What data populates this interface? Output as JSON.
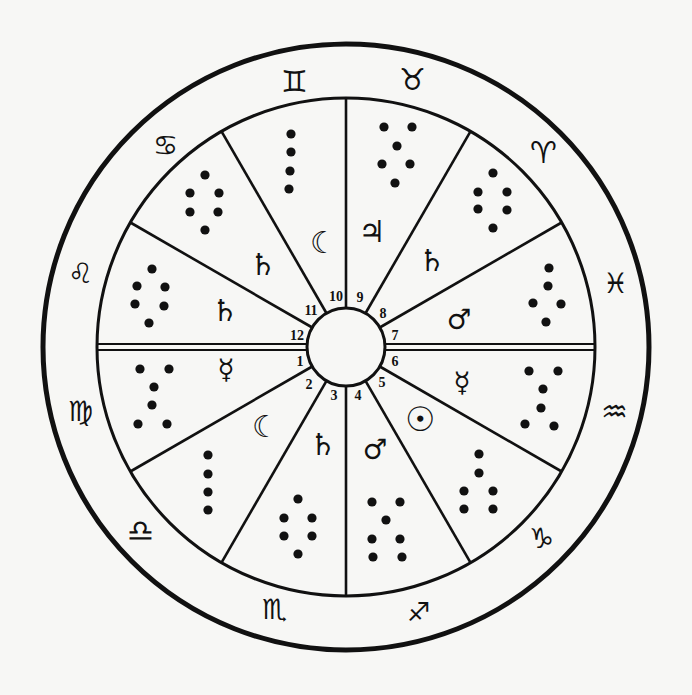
{
  "diagram": {
    "type": "astrological-house-chart",
    "colors": {
      "ink": "#111111",
      "paper": "#f7f7f5"
    },
    "geometry": {
      "cx": 346,
      "cy": 347,
      "outer_r": 303,
      "ring_r": 249,
      "hub_r": 39
    },
    "zodiac_signs": [
      {
        "name": "gemini",
        "glyph": "♊",
        "x": 294,
        "y": 81,
        "size": 30
      },
      {
        "name": "taurus",
        "glyph": "♉",
        "x": 412,
        "y": 79,
        "size": 30
      },
      {
        "name": "cancer",
        "glyph": "♋",
        "x": 165,
        "y": 145,
        "size": 28
      },
      {
        "name": "aries",
        "glyph": "♈",
        "x": 543,
        "y": 152,
        "size": 30
      },
      {
        "name": "leo",
        "glyph": "♌",
        "x": 80,
        "y": 273,
        "size": 28
      },
      {
        "name": "pisces",
        "glyph": "♓",
        "x": 615,
        "y": 283,
        "size": 28
      },
      {
        "name": "virgo",
        "glyph": "♍",
        "x": 80,
        "y": 411,
        "size": 28
      },
      {
        "name": "aquarius",
        "glyph": "♒",
        "x": 614,
        "y": 411,
        "size": 30
      },
      {
        "name": "libra",
        "glyph": "♎",
        "x": 140,
        "y": 530,
        "size": 30
      },
      {
        "name": "capricorn",
        "glyph": "♑",
        "x": 541,
        "y": 538,
        "size": 28
      },
      {
        "name": "scorpio",
        "glyph": "♏",
        "x": 274,
        "y": 609,
        "size": 28
      },
      {
        "name": "sagittarius",
        "glyph": "♐",
        "x": 418,
        "y": 612,
        "size": 26
      }
    ],
    "house_numbers": [
      {
        "label": "1",
        "x": 300,
        "y": 361
      },
      {
        "label": "2",
        "x": 309,
        "y": 384
      },
      {
        "label": "3",
        "x": 334,
        "y": 395
      },
      {
        "label": "4",
        "x": 358,
        "y": 395
      },
      {
        "label": "5",
        "x": 382,
        "y": 382
      },
      {
        "label": "6",
        "x": 395,
        "y": 361
      },
      {
        "label": "7",
        "x": 395,
        "y": 335
      },
      {
        "label": "8",
        "x": 383,
        "y": 313
      },
      {
        "label": "9",
        "x": 360,
        "y": 297
      },
      {
        "label": "10",
        "x": 336,
        "y": 296
      },
      {
        "label": "11",
        "x": 311,
        "y": 310
      },
      {
        "label": "12",
        "x": 297,
        "y": 335
      }
    ],
    "planets": [
      {
        "house": 10,
        "name": "moon",
        "glyph": "☾",
        "x": 323,
        "y": 242,
        "size": 30
      },
      {
        "house": 9,
        "name": "jupiter",
        "glyph": "♃",
        "x": 372,
        "y": 231,
        "size": 30
      },
      {
        "house": 8,
        "name": "saturn",
        "glyph": "♄",
        "x": 432,
        "y": 260,
        "size": 30
      },
      {
        "house": 7,
        "name": "mars",
        "glyph": "♂",
        "x": 459,
        "y": 319,
        "size": 28
      },
      {
        "house": 6,
        "name": "mercury",
        "glyph": "☿",
        "x": 462,
        "y": 382,
        "size": 28
      },
      {
        "house": 5,
        "name": "sun",
        "glyph": "☉",
        "x": 420,
        "y": 419,
        "size": 34
      },
      {
        "house": 4,
        "name": "mars",
        "glyph": "♂",
        "x": 375,
        "y": 449,
        "size": 28
      },
      {
        "house": 3,
        "name": "saturn",
        "glyph": "♄",
        "x": 323,
        "y": 444,
        "size": 30
      },
      {
        "house": 2,
        "name": "moon",
        "glyph": "☾",
        "x": 265,
        "y": 426,
        "size": 30
      },
      {
        "house": 1,
        "name": "mercury",
        "glyph": "☿",
        "x": 226,
        "y": 369,
        "size": 28
      },
      {
        "house": 12,
        "name": "saturn",
        "glyph": "♄",
        "x": 225,
        "y": 310,
        "size": 30
      },
      {
        "house": 11,
        "name": "saturn",
        "glyph": "♄",
        "x": 263,
        "y": 264,
        "size": 30
      }
    ],
    "geomantic_figures": [
      {
        "house": 1,
        "dots": [
          [
            140,
            369
          ],
          [
            169,
            369
          ],
          [
            154,
            387
          ],
          [
            152,
            405
          ],
          [
            138,
            424
          ],
          [
            167,
            424
          ]
        ]
      },
      {
        "house": 2,
        "dots": [
          [
            208,
            455
          ],
          [
            208,
            474
          ],
          [
            208,
            492
          ],
          [
            208,
            510
          ]
        ]
      },
      {
        "house": 3,
        "dots": [
          [
            298,
            499
          ],
          [
            284,
            518
          ],
          [
            312,
            518
          ],
          [
            284,
            536
          ],
          [
            312,
            536
          ],
          [
            298,
            554
          ]
        ]
      },
      {
        "house": 4,
        "dots": [
          [
            372,
            502
          ],
          [
            400,
            502
          ],
          [
            386,
            520
          ],
          [
            372,
            539
          ],
          [
            400,
            539
          ],
          [
            373,
            557
          ],
          [
            402,
            557
          ]
        ]
      },
      {
        "house": 5,
        "dots": [
          [
            479,
            454
          ],
          [
            479,
            473
          ],
          [
            464,
            491
          ],
          [
            493,
            491
          ],
          [
            464,
            509
          ],
          [
            493,
            509
          ]
        ]
      },
      {
        "house": 6,
        "dots": [
          [
            529,
            371
          ],
          [
            558,
            371
          ],
          [
            543,
            389
          ],
          [
            541,
            408
          ],
          [
            525,
            424
          ],
          [
            554,
            426
          ]
        ]
      },
      {
        "house": 7,
        "dots": [
          [
            549,
            268
          ],
          [
            548,
            286
          ],
          [
            533,
            303
          ],
          [
            561,
            304
          ],
          [
            546,
            322
          ]
        ]
      },
      {
        "house": 8,
        "dots": [
          [
            493,
            173
          ],
          [
            478,
            192
          ],
          [
            507,
            192
          ],
          [
            478,
            209
          ],
          [
            507,
            210
          ],
          [
            493,
            228
          ]
        ]
      },
      {
        "house": 9,
        "dots": [
          [
            384,
            127
          ],
          [
            412,
            127
          ],
          [
            397,
            146
          ],
          [
            382,
            164
          ],
          [
            410,
            164
          ],
          [
            395,
            183
          ]
        ]
      },
      {
        "house": 10,
        "dots": [
          [
            291,
            134
          ],
          [
            291,
            152
          ],
          [
            290,
            171
          ],
          [
            289,
            189
          ]
        ]
      },
      {
        "house": 11,
        "dots": [
          [
            205,
            175
          ],
          [
            190,
            193
          ],
          [
            219,
            193
          ],
          [
            190,
            212
          ],
          [
            218,
            212
          ],
          [
            205,
            230
          ]
        ]
      },
      {
        "house": 12,
        "dots": [
          [
            152,
            269
          ],
          [
            137,
            286
          ],
          [
            165,
            287
          ],
          [
            135,
            304
          ],
          [
            164,
            306
          ],
          [
            149,
            323
          ]
        ]
      }
    ],
    "house_cusp_angles_deg": [
      0,
      30,
      60,
      90,
      120,
      150,
      180,
      210,
      240,
      270,
      300,
      330
    ]
  }
}
